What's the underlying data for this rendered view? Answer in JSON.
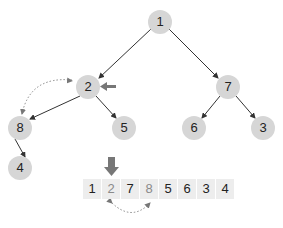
{
  "diagram": {
    "type": "binary-heap-swap-illustration",
    "caption_clipped": "",
    "colors": {
      "node_fill": "#d6d6d6",
      "edge": "#333333",
      "highlight_arrow": "#777777",
      "swap_arrow": "#888888",
      "cell_fill": "#ededed",
      "swapped_text": "#8a8a8a"
    },
    "tree": {
      "nodes": [
        {
          "id": "n1",
          "label": "1",
          "x": 160,
          "y": 22
        },
        {
          "id": "n2",
          "label": "2",
          "x": 88,
          "y": 87
        },
        {
          "id": "n7",
          "label": "7",
          "x": 228,
          "y": 87
        },
        {
          "id": "n8",
          "label": "8",
          "x": 20,
          "y": 128
        },
        {
          "id": "n5",
          "label": "5",
          "x": 124,
          "y": 128
        },
        {
          "id": "n6",
          "label": "6",
          "x": 194,
          "y": 128
        },
        {
          "id": "n3",
          "label": "3",
          "x": 263,
          "y": 128
        },
        {
          "id": "n4",
          "label": "4",
          "x": 20,
          "y": 168
        }
      ],
      "edges": [
        [
          "1",
          "2"
        ],
        [
          "1",
          "7"
        ],
        [
          "2",
          "8"
        ],
        [
          "2",
          "5"
        ],
        [
          "7",
          "6"
        ],
        [
          "7",
          "3"
        ],
        [
          "8",
          "4"
        ]
      ],
      "pointer_target": "2",
      "swap_pair": [
        "2",
        "8"
      ]
    },
    "array": {
      "cells": [
        {
          "label": "1",
          "swapped": false
        },
        {
          "label": "2",
          "swapped": true
        },
        {
          "label": "7",
          "swapped": false
        },
        {
          "label": "8",
          "swapped": true
        },
        {
          "label": "5",
          "swapped": false
        },
        {
          "label": "6",
          "swapped": false
        },
        {
          "label": "3",
          "swapped": false
        },
        {
          "label": "4",
          "swapped": false
        }
      ],
      "pointer_index": 1,
      "swap_indices": [
        1,
        3
      ]
    }
  }
}
